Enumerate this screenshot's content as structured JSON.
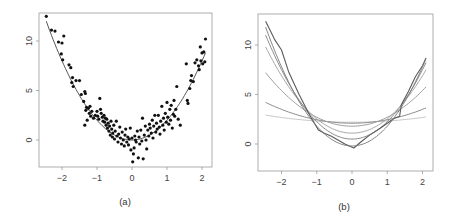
{
  "chart_data": [
    {
      "id": "a",
      "type": "scatter",
      "title": "",
      "caption": "(a)",
      "xlabel": "",
      "ylabel": "",
      "xlim": [
        -2.6,
        2.3
      ],
      "ylim": [
        -3,
        13
      ],
      "xticks": [
        -2,
        -1,
        0,
        1,
        2
      ],
      "yticks": [
        0,
        5,
        10
      ],
      "xtick_labels": [
        "−2",
        "−1",
        "0",
        "1",
        "2"
      ],
      "ytick_labels": [
        "0",
        "5",
        "10"
      ],
      "grid": false,
      "fit_curve": {
        "name": "true function",
        "formula": "y = 2x^2",
        "x_range": [
          -2.45,
          2.1
        ]
      },
      "points": [
        [
          -2.45,
          12.5
        ],
        [
          -2.3,
          11.1
        ],
        [
          -2.2,
          11.0
        ],
        [
          -2.1,
          9.9
        ],
        [
          -2.0,
          9.8
        ],
        [
          -1.95,
          10.5
        ],
        [
          -2.02,
          8.7
        ],
        [
          -1.98,
          8.1
        ],
        [
          -1.8,
          7.6
        ],
        [
          -1.75,
          7.3
        ],
        [
          -1.7,
          6.3
        ],
        [
          -1.72,
          5.8
        ],
        [
          -1.68,
          5.4
        ],
        [
          -1.6,
          6.0
        ],
        [
          -1.5,
          6.0
        ],
        [
          -1.45,
          4.6
        ],
        [
          -1.35,
          4.9
        ],
        [
          -1.33,
          4.7
        ],
        [
          -1.38,
          3.9
        ],
        [
          -1.3,
          3.3
        ],
        [
          -1.25,
          3.2
        ],
        [
          -1.32,
          3.0
        ],
        [
          -1.2,
          3.4
        ],
        [
          -1.22,
          2.7
        ],
        [
          -1.18,
          2.4
        ],
        [
          -1.15,
          2.9
        ],
        [
          -1.1,
          2.2
        ],
        [
          -1.05,
          2.5
        ],
        [
          -1.28,
          2.0
        ],
        [
          -1.35,
          1.5
        ],
        [
          -1.0,
          2.9
        ],
        [
          -0.98,
          2.4
        ],
        [
          -0.95,
          2.1
        ],
        [
          -0.92,
          4.2
        ],
        [
          -0.9,
          3.1
        ],
        [
          -0.88,
          2.7
        ],
        [
          -0.85,
          2.3
        ],
        [
          -0.83,
          1.9
        ],
        [
          -0.8,
          2.5
        ],
        [
          -0.78,
          1.8
        ],
        [
          -0.76,
          2.2
        ],
        [
          -0.74,
          1.5
        ],
        [
          -0.72,
          2.1
        ],
        [
          -0.7,
          1.2
        ],
        [
          -0.68,
          1.7
        ],
        [
          -0.66,
          0.9
        ],
        [
          -0.64,
          1.4
        ],
        [
          -0.62,
          0.5
        ],
        [
          -0.6,
          1.9
        ],
        [
          -0.58,
          1.1
        ],
        [
          -0.56,
          0.3
        ],
        [
          -0.55,
          0.7
        ],
        [
          -0.52,
          1.5
        ],
        [
          -0.5,
          0.1
        ],
        [
          -0.48,
          0.9
        ],
        [
          -0.45,
          1.9
        ],
        [
          -0.43,
          0.4
        ],
        [
          -0.4,
          -0.2
        ],
        [
          -0.38,
          0.6
        ],
        [
          -0.35,
          1.3
        ],
        [
          -0.33,
          0.2
        ],
        [
          -0.3,
          -0.4
        ],
        [
          -0.28,
          0.8
        ],
        [
          -0.25,
          0.0
        ],
        [
          -0.22,
          -0.6
        ],
        [
          -0.2,
          0.5
        ],
        [
          -0.18,
          1.1
        ],
        [
          -0.15,
          -0.2
        ],
        [
          -0.12,
          0.3
        ],
        [
          -0.1,
          -0.5
        ],
        [
          -0.08,
          0.1
        ],
        [
          -0.05,
          1.2
        ],
        [
          -0.03,
          -1.0
        ],
        [
          0.0,
          0.2
        ],
        [
          0.02,
          -2.2
        ],
        [
          0.04,
          -1.4
        ],
        [
          0.06,
          -0.8
        ],
        [
          0.08,
          0.4
        ],
        [
          0.1,
          0.0
        ],
        [
          0.12,
          -0.2
        ],
        [
          0.15,
          0.9
        ],
        [
          0.18,
          -1.8
        ],
        [
          0.2,
          0.3
        ],
        [
          0.22,
          -0.4
        ],
        [
          0.25,
          1.0
        ],
        [
          0.28,
          -0.1
        ],
        [
          0.3,
          2.2
        ],
        [
          0.32,
          -1.9
        ],
        [
          0.35,
          0.5
        ],
        [
          0.38,
          1.4
        ],
        [
          0.4,
          0.0
        ],
        [
          0.42,
          -0.9
        ],
        [
          0.45,
          1.0
        ],
        [
          0.48,
          0.4
        ],
        [
          0.5,
          1.6
        ],
        [
          0.52,
          1.2
        ],
        [
          0.55,
          0.7
        ],
        [
          0.58,
          2.0
        ],
        [
          0.6,
          0.2
        ],
        [
          0.62,
          1.4
        ],
        [
          0.65,
          2.5
        ],
        [
          0.68,
          0.8
        ],
        [
          0.7,
          1.7
        ],
        [
          0.72,
          1.1
        ],
        [
          0.75,
          2.5
        ],
        [
          0.78,
          1.3
        ],
        [
          0.8,
          0.6
        ],
        [
          0.82,
          1.9
        ],
        [
          0.85,
          3.4
        ],
        [
          0.88,
          1.5
        ],
        [
          0.9,
          2.2
        ],
        [
          0.92,
          1.0
        ],
        [
          0.95,
          2.7
        ],
        [
          0.98,
          1.8
        ],
        [
          1.0,
          3.8
        ],
        [
          1.02,
          2.3
        ],
        [
          1.05,
          1.6
        ],
        [
          1.08,
          3.1
        ],
        [
          1.1,
          2.0
        ],
        [
          1.12,
          3.5
        ],
        [
          1.15,
          1.2
        ],
        [
          1.18,
          2.6
        ],
        [
          1.2,
          4.0
        ],
        [
          1.22,
          2.4
        ],
        [
          1.25,
          3.1
        ],
        [
          1.28,
          5.4
        ],
        [
          1.32,
          2.1
        ],
        [
          1.38,
          1.5
        ],
        [
          1.55,
          7.7
        ],
        [
          1.58,
          4.0
        ],
        [
          1.6,
          3.7
        ],
        [
          1.65,
          5.2
        ],
        [
          1.68,
          6.0
        ],
        [
          1.7,
          6.5
        ],
        [
          1.75,
          5.9
        ],
        [
          1.8,
          7.8
        ],
        [
          1.85,
          8.1
        ],
        [
          1.9,
          7.5
        ],
        [
          1.92,
          7.1
        ],
        [
          1.95,
          9.4
        ],
        [
          1.97,
          8.0
        ],
        [
          2.0,
          8.8
        ],
        [
          2.02,
          7.7
        ],
        [
          2.05,
          8.9
        ],
        [
          2.08,
          7.9
        ],
        [
          2.1,
          10.2
        ]
      ]
    },
    {
      "id": "b",
      "type": "line",
      "title": "",
      "caption": "(b)",
      "xlabel": "",
      "ylabel": "",
      "xlim": [
        -2.6,
        2.3
      ],
      "ylim": [
        -3,
        13
      ],
      "xticks": [
        -2,
        -1,
        0,
        1,
        2
      ],
      "yticks": [
        0,
        5,
        10
      ],
      "xtick_labels": [
        "−2",
        "−1",
        "0",
        "1",
        "2"
      ],
      "ytick_labels": [
        "0",
        "5",
        "10"
      ],
      "grid": false,
      "series": [
        {
          "name": "fit 1 (near-flat)",
          "formula": "y = 2.2 + 0.12x^2",
          "color": "#c8c8c8"
        },
        {
          "name": "fit 2",
          "formula": "y = 2.1 + 0.35x^2",
          "color": "#8a8a8a"
        },
        {
          "name": "fit 3",
          "formula": "y = 1.8 + 0.9x^2",
          "color": "#9e9e9e"
        },
        {
          "name": "fit 4",
          "formula": "y = 1.1 + 1.45x^2",
          "color": "#a8a8a8"
        },
        {
          "name": "fit 5",
          "formula": "y = 0.5 + 1.75x^2",
          "color": "#8c8c8c"
        },
        {
          "name": "fit 6 (wiggly)",
          "formula": "y ≈ 2x^2 - 0.3",
          "color": "#5a5a5a"
        }
      ],
      "wiggly_points": [
        [
          -2.45,
          12.4
        ],
        [
          -2.2,
          10.6
        ],
        [
          -2.0,
          9.5
        ],
        [
          -1.8,
          7.3
        ],
        [
          -1.5,
          5.0
        ],
        [
          -1.2,
          2.9
        ],
        [
          -0.95,
          1.4
        ],
        [
          -0.8,
          1.1
        ],
        [
          -0.6,
          0.8
        ],
        [
          -0.4,
          0.4
        ],
        [
          -0.2,
          0.0
        ],
        [
          0.05,
          -0.4
        ],
        [
          0.25,
          0.2
        ],
        [
          0.5,
          0.9
        ],
        [
          0.8,
          1.6
        ],
        [
          1.0,
          2.1
        ],
        [
          1.2,
          2.6
        ],
        [
          1.35,
          2.8
        ],
        [
          1.4,
          4.0
        ],
        [
          1.6,
          5.3
        ],
        [
          1.8,
          6.8
        ],
        [
          2.0,
          7.9
        ],
        [
          2.1,
          8.7
        ]
      ]
    }
  ],
  "captions": {
    "a": "(a)",
    "b": "(b)"
  },
  "ticks": {
    "x": [
      "−2",
      "−1",
      "0",
      "1",
      "2"
    ],
    "y": [
      "0",
      "5",
      "10"
    ]
  },
  "colors": {
    "frame": "#9a9a9a",
    "points": "#111111",
    "fit_line": "#444444"
  }
}
